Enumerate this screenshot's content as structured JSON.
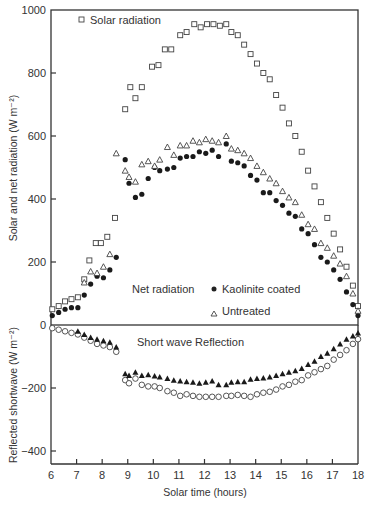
{
  "chart_data": [
    {
      "type": "scatter",
      "panel": "upper",
      "title": "",
      "xlabel": "Solar time (hours)",
      "ylabel": "Solar and net radiation (W m⁻²)",
      "xlim": [
        6,
        18
      ],
      "ylim": [
        0,
        1000
      ],
      "yticks": [
        0,
        200,
        400,
        600,
        800,
        1000
      ],
      "xticks": [
        6,
        7,
        8,
        9,
        10,
        11,
        12,
        13,
        14,
        15,
        16,
        17,
        18
      ],
      "grid": false,
      "annotations": [
        "Net radiation"
      ],
      "legend": [
        "Solar radiation",
        "Kaolinite coated",
        "Untreated"
      ],
      "series": [
        {
          "name": "Solar radiation",
          "marker": "open-square",
          "x": [
            6.05,
            6.3,
            6.55,
            6.8,
            7.05,
            7.3,
            7.5,
            7.75,
            7.95,
            8.2,
            8.5,
            8.9,
            9.1,
            9.3,
            9.55,
            9.95,
            10.2,
            10.45,
            10.7,
            11.05,
            11.3,
            11.6,
            11.85,
            12.1,
            12.35,
            12.6,
            12.85,
            13.05,
            13.3,
            13.55,
            13.8,
            14.05,
            14.3,
            14.55,
            14.8,
            15.05,
            15.3,
            15.55,
            15.8,
            16.05,
            16.3,
            16.55,
            16.8,
            17.05,
            17.3,
            17.55,
            17.8,
            18.0
          ],
          "y": [
            50,
            60,
            75,
            82,
            88,
            145,
            205,
            260,
            260,
            280,
            340,
            685,
            755,
            720,
            755,
            820,
            825,
            875,
            875,
            920,
            930,
            955,
            945,
            955,
            955,
            950,
            955,
            930,
            920,
            890,
            860,
            830,
            800,
            780,
            730,
            690,
            640,
            600,
            550,
            490,
            440,
            390,
            340,
            290,
            240,
            185,
            125,
            60
          ]
        },
        {
          "name": "Kaolinite coated",
          "marker": "filled-circle",
          "x": [
            6.05,
            6.3,
            6.55,
            6.8,
            7.05,
            7.3,
            7.55,
            7.8,
            8.05,
            8.3,
            8.55,
            8.9,
            9.05,
            9.3,
            9.55,
            9.8,
            10.05,
            10.25,
            10.55,
            10.8,
            11.05,
            11.3,
            11.55,
            11.8,
            12.05,
            12.3,
            12.55,
            12.85,
            13.05,
            13.3,
            13.55,
            13.8,
            14.05,
            14.3,
            14.55,
            14.8,
            15.05,
            15.3,
            15.55,
            15.8,
            16.05,
            16.3,
            16.55,
            16.8,
            17.05,
            17.3,
            17.55,
            17.8,
            18.0
          ],
          "y": [
            30,
            40,
            50,
            55,
            55,
            95,
            130,
            155,
            150,
            175,
            215,
            525,
            450,
            405,
            415,
            465,
            500,
            490,
            495,
            500,
            530,
            535,
            535,
            550,
            545,
            555,
            535,
            575,
            520,
            515,
            505,
            475,
            460,
            420,
            420,
            395,
            380,
            355,
            345,
            305,
            290,
            255,
            215,
            200,
            175,
            145,
            105,
            65,
            30
          ]
        },
        {
          "name": "Untreated",
          "marker": "open-triangle",
          "x": [
            7.3,
            7.55,
            7.8,
            8.05,
            8.3,
            8.55,
            8.9,
            9.05,
            9.3,
            9.55,
            9.8,
            10.05,
            10.25,
            10.55,
            10.8,
            11.05,
            11.3,
            11.55,
            11.8,
            12.05,
            12.3,
            12.55,
            12.85,
            13.05,
            13.3,
            13.55,
            13.8,
            14.05,
            14.3,
            14.55,
            14.8,
            15.05,
            15.3,
            15.55,
            15.8,
            16.05,
            16.3,
            16.55,
            16.8,
            17.05,
            17.3,
            17.55,
            17.8,
            18.0
          ],
          "y": [
            135,
            170,
            165,
            185,
            225,
            545,
            490,
            470,
            455,
            510,
            520,
            505,
            525,
            565,
            540,
            570,
            570,
            585,
            580,
            590,
            585,
            580,
            600,
            560,
            555,
            545,
            530,
            505,
            485,
            465,
            450,
            425,
            405,
            390,
            350,
            320,
            305,
            260,
            245,
            220,
            195,
            155,
            100,
            45
          ]
        }
      ]
    },
    {
      "type": "scatter",
      "panel": "lower",
      "title": "",
      "xlabel": "Solar time (hours)",
      "ylabel": "Reflected shortwave (W m⁻²)",
      "xlim": [
        6,
        18
      ],
      "ylim": [
        -430,
        0
      ],
      "yticks": [
        -400,
        -200,
        0
      ],
      "xticks": [
        6,
        7,
        8,
        9,
        10,
        11,
        12,
        13,
        14,
        15,
        16,
        17,
        18
      ],
      "grid": false,
      "annotations": [
        "Short wave Reflection"
      ],
      "series": [
        {
          "name": "Kaolinite coated",
          "marker": "open-circle",
          "x": [
            6.05,
            6.3,
            6.55,
            6.8,
            7.05,
            7.3,
            7.55,
            7.8,
            8.05,
            8.3,
            8.55,
            8.9,
            9.05,
            9.3,
            9.55,
            9.8,
            10.05,
            10.25,
            10.55,
            10.8,
            11.05,
            11.3,
            11.55,
            11.8,
            12.05,
            12.3,
            12.55,
            12.85,
            13.05,
            13.3,
            13.55,
            13.8,
            14.05,
            14.3,
            14.55,
            14.8,
            15.05,
            15.3,
            15.55,
            15.8,
            16.05,
            16.3,
            16.55,
            16.8,
            17.05,
            17.3,
            17.55,
            17.8,
            18.0
          ],
          "y": [
            -10,
            -15,
            -20,
            -25,
            -30,
            -40,
            -50,
            -60,
            -65,
            -70,
            -85,
            -175,
            -185,
            -170,
            -190,
            -195,
            -195,
            -200,
            -210,
            -215,
            -225,
            -220,
            -225,
            -228,
            -228,
            -228,
            -228,
            -225,
            -225,
            -222,
            -225,
            -228,
            -220,
            -215,
            -212,
            -205,
            -195,
            -190,
            -180,
            -175,
            -160,
            -150,
            -140,
            -130,
            -110,
            -95,
            -80,
            -60,
            -45
          ]
        },
        {
          "name": "Untreated",
          "marker": "filled-triangle",
          "x": [
            7.05,
            7.3,
            7.55,
            7.8,
            8.05,
            8.3,
            8.55,
            8.9,
            9.05,
            9.3,
            9.55,
            9.8,
            10.05,
            10.25,
            10.55,
            10.8,
            11.05,
            11.3,
            11.55,
            11.8,
            12.05,
            12.3,
            12.55,
            12.85,
            13.05,
            13.3,
            13.55,
            13.8,
            14.05,
            14.3,
            14.55,
            14.8,
            15.05,
            15.3,
            15.55,
            15.8,
            16.05,
            16.3,
            16.55,
            16.8,
            17.05,
            17.3,
            17.55,
            17.8,
            18.0
          ],
          "y": [
            -20,
            -30,
            -40,
            -45,
            -50,
            -55,
            -70,
            -155,
            -160,
            -150,
            -160,
            -158,
            -162,
            -165,
            -170,
            -175,
            -178,
            -180,
            -182,
            -185,
            -182,
            -178,
            -190,
            -190,
            -182,
            -180,
            -180,
            -172,
            -170,
            -168,
            -165,
            -160,
            -155,
            -150,
            -145,
            -138,
            -125,
            -115,
            -100,
            -90,
            -75,
            -60,
            -45,
            -35,
            -25
          ]
        }
      ]
    }
  ],
  "labels": {
    "legend_solar": "Solar radiation",
    "annotation_net": "Net radiation",
    "legend_kaolinite": "Kaolinite coated",
    "legend_untreated": "Untreated",
    "annotation_shortwave": "Short wave Reflection",
    "xlabel": "Solar time (hours)",
    "ylabel_upper": "Solar and net radiation (W m⁻²)",
    "ylabel_lower": "Reflected shortwave (W m⁻²)"
  }
}
